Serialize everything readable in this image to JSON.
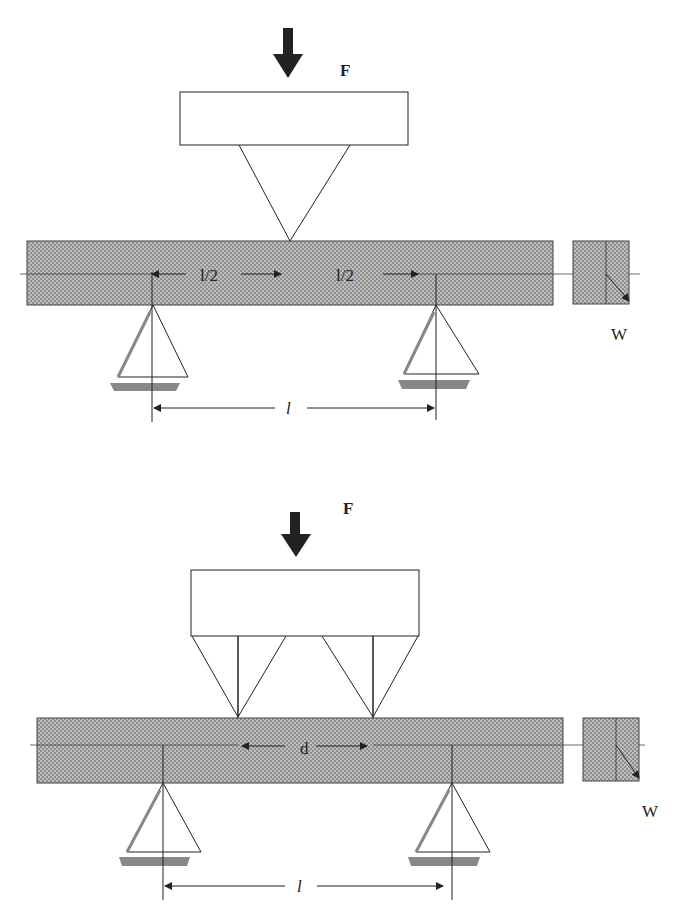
{
  "diagrams": [
    {
      "name": "three-point-bending",
      "force_label": "F",
      "half_span_labels": [
        "l/2",
        "l/2"
      ],
      "span_label": "l",
      "width_label": "W"
    },
    {
      "name": "four-point-bending",
      "force_label": "F",
      "inner_span_label": "d",
      "span_label": "l",
      "width_label": "W"
    }
  ],
  "colors": {
    "beam_fill": "#9a9a9a",
    "stroke": "#222222",
    "support_shadow": "#888888"
  }
}
